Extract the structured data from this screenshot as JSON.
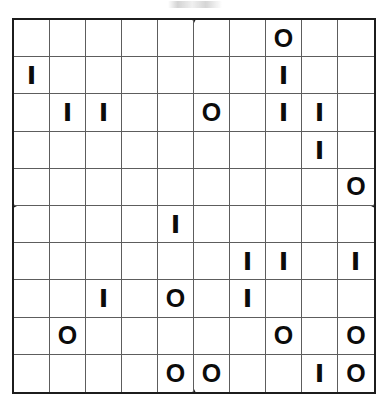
{
  "page": {
    "background_color": "#ffffff",
    "header_artifact_text": ""
  },
  "puzzle": {
    "name": "binairo-grid",
    "rows": 10,
    "columns": 10,
    "symbols": [
      "O",
      "I"
    ],
    "border_color": "#1c1c1c",
    "gridline_color": "#5d5d5d",
    "glyph_color": "#0b0b0b",
    "ticks": [
      "top",
      "right",
      "bottom",
      "left"
    ],
    "cells": [
      [
        "",
        "",
        "",
        "",
        "",
        "",
        "",
        "O",
        "",
        ""
      ],
      [
        "I",
        "",
        "",
        "",
        "",
        "",
        "",
        "I",
        "",
        ""
      ],
      [
        "",
        "I",
        "I",
        "",
        "",
        "O",
        "",
        "I",
        "I",
        ""
      ],
      [
        "",
        "",
        "",
        "",
        "",
        "",
        "",
        "",
        "I",
        ""
      ],
      [
        "",
        "",
        "",
        "",
        "",
        "",
        "",
        "",
        "",
        "O"
      ],
      [
        "",
        "",
        "",
        "",
        "I",
        "",
        "",
        "",
        "",
        ""
      ],
      [
        "",
        "",
        "",
        "",
        "",
        "",
        "I",
        "I",
        "",
        "I"
      ],
      [
        "",
        "",
        "I",
        "",
        "O",
        "",
        "I",
        "",
        "",
        ""
      ],
      [
        "",
        "O",
        "",
        "",
        "",
        "",
        "",
        "O",
        "",
        "O"
      ],
      [
        "",
        "",
        "",
        "",
        "O",
        "O",
        "",
        "",
        "I",
        "O"
      ]
    ]
  }
}
